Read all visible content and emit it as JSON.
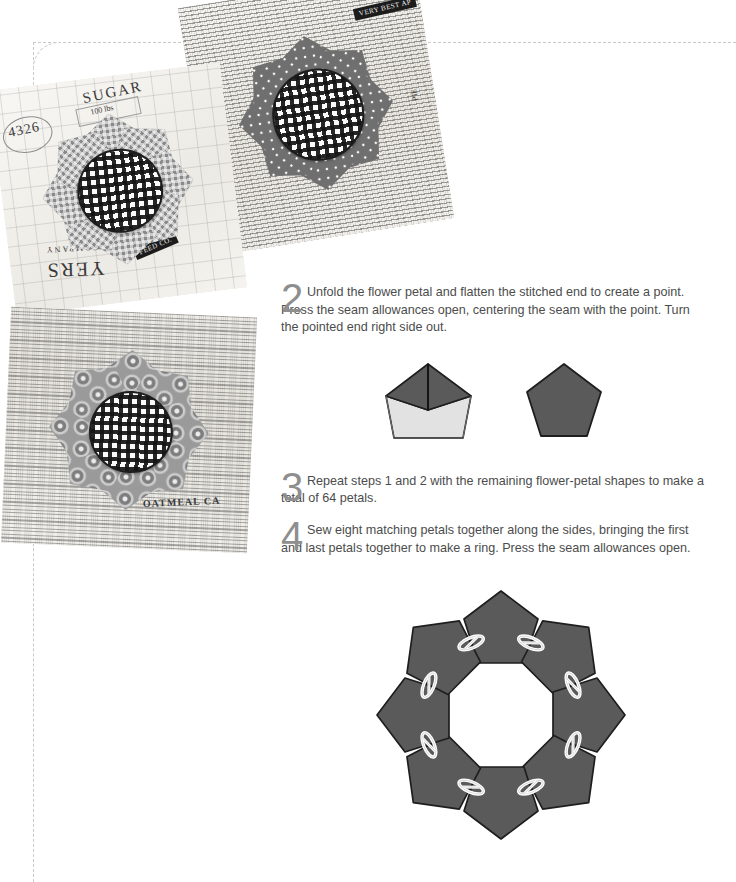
{
  "page": {
    "kind": "quilting-instruction-page",
    "trim_guide_color": "#c9c9c9",
    "background": "#ffffff"
  },
  "steps": [
    {
      "number": "2",
      "text": "Unfold the flower petal and flatten the stitched end to create a point. Press the seam allowances open, centering the seam with the point. Turn the pointed end right side out."
    },
    {
      "number": "3",
      "text": "Repeat steps 1 and 2 with the remaining flower-petal shapes to make a total of 64 petals."
    },
    {
      "number": "4",
      "text": "Sew eight matching petals together along the sides, bringing the first and last petals together to make a ring. Press the seam allowances open."
    }
  ],
  "diagrams": {
    "folded_petal": {
      "label": "folded-petal-diagram",
      "fabric_dark": "#5a5a5a",
      "fabric_light": "#e2e2e2",
      "outline": "#1e1e1e"
    },
    "finished_pentagon": {
      "label": "finished-pentagon-diagram",
      "fabric_dark": "#5a5a5a",
      "outline": "#1e1e1e"
    },
    "petal_ring": {
      "label": "eight-petal-ring-diagram",
      "petal_count": 8,
      "clip_count": 8,
      "fabric_dark": "#5a5a5a",
      "outline": "#1e1e1e",
      "clip_color": "#ffffff"
    }
  },
  "photos": [
    {
      "name": "photo-newsprint-dotty-block",
      "caption_text_on_fabric": [
        "VERY BEST AP",
        "PIE"
      ],
      "petal_fabric": "dotted",
      "center_fabric": "gingham"
    },
    {
      "name": "photo-sugar-sack-gingham-block",
      "caption_text_on_fabric": [
        "SUGAR",
        "100 lbs",
        "4326",
        "YERS",
        "COMPANY",
        "FEED CO."
      ],
      "petal_fabric": "gingham",
      "center_fabric": "gingham"
    },
    {
      "name": "photo-oatmeal-medallion-block",
      "caption_text_on_fabric": [
        "OATMEAL CA"
      ],
      "petal_fabric": "medallion",
      "center_fabric": "gingham"
    }
  ]
}
